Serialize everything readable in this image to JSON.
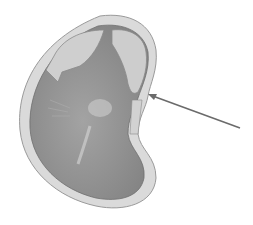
{
  "diagram": {
    "colors": {
      "background": "#ffffff",
      "outer_coat": "#d9d9d9",
      "outer_coat_stroke": "#9a9a9a",
      "inner_body": "#8f8f8f",
      "cotyledon_flap": "#c8c8c8",
      "highlight": "#c4c4c4",
      "arrow": "#6b6b6b"
    },
    "arrow": {
      "from": [
        240,
        128
      ],
      "to": [
        148,
        94
      ]
    }
  }
}
